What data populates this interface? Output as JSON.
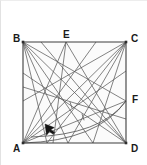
{
  "figure": {
    "type": "geometry-diagram",
    "background_color": "#ffffff",
    "fill_color": "#fbfbfb",
    "line_color": "#5a5a5a",
    "square_line_color": "#3c3c3c",
    "label_color": "#1a1a1a",
    "frame_border_color": "#e4e4e4",
    "square": {
      "corners": {
        "A": {
          "x": 22,
          "y": 142
        },
        "B": {
          "x": 22,
          "y": 41
        },
        "C": {
          "x": 125,
          "y": 41
        },
        "D": {
          "x": 125,
          "y": 142
        }
      },
      "points_on_edges": {
        "E": {
          "x": 65,
          "y": 41,
          "edge": "top"
        },
        "F": {
          "x": 125,
          "y": 100,
          "edge": "right"
        }
      }
    },
    "labels": [
      {
        "name": "B",
        "text": "B",
        "x": 12,
        "y": 33
      },
      {
        "name": "E",
        "text": "E",
        "x": 62,
        "y": 29
      },
      {
        "name": "C",
        "text": "C",
        "x": 130,
        "y": 33
      },
      {
        "name": "F",
        "text": "F",
        "x": 131,
        "y": 94
      },
      {
        "name": "A",
        "text": "A",
        "x": 12,
        "y": 143
      },
      {
        "name": "D",
        "text": "D",
        "x": 130,
        "y": 143
      }
    ],
    "cursor": {
      "x": 44,
      "y": 123,
      "color": "#151515"
    },
    "segments": [
      {
        "from": [
          22,
          41
        ],
        "to": [
          125,
          142
        ]
      },
      {
        "from": [
          22,
          142
        ],
        "to": [
          125,
          41
        ]
      },
      {
        "from": [
          22,
          41
        ],
        "to": [
          125,
          100
        ]
      },
      {
        "from": [
          22,
          41
        ],
        "to": [
          92,
          142
        ]
      },
      {
        "from": [
          22,
          41
        ],
        "to": [
          67,
          142
        ]
      },
      {
        "from": [
          22,
          41
        ],
        "to": [
          46,
          142
        ]
      },
      {
        "from": [
          125,
          41
        ],
        "to": [
          22,
          100
        ]
      },
      {
        "from": [
          125,
          41
        ],
        "to": [
          46,
          142
        ]
      },
      {
        "from": [
          125,
          41
        ],
        "to": [
          67,
          142
        ]
      },
      {
        "from": [
          125,
          41
        ],
        "to": [
          92,
          142
        ]
      },
      {
        "from": [
          22,
          142
        ],
        "to": [
          125,
          70
        ]
      },
      {
        "from": [
          22,
          142
        ],
        "to": [
          125,
          100
        ]
      },
      {
        "from": [
          22,
          142
        ],
        "to": [
          95,
          41
        ]
      },
      {
        "from": [
          22,
          142
        ],
        "to": [
          65,
          41
        ]
      },
      {
        "from": [
          125,
          142
        ],
        "to": [
          22,
          72
        ]
      },
      {
        "from": [
          125,
          142
        ],
        "to": [
          65,
          41
        ]
      },
      {
        "from": [
          125,
          142
        ],
        "to": [
          40,
          41
        ]
      },
      {
        "from": [
          65,
          41
        ],
        "to": [
          52,
          142
        ]
      },
      {
        "from": [
          22,
          86
        ],
        "to": [
          125,
          118
        ]
      }
    ],
    "arcs": [
      {
        "from": [
          22,
          142
        ],
        "to": [
          125,
          100
        ],
        "sweep_control": [
          96,
          140
        ]
      },
      {
        "from": [
          30,
          136
        ],
        "to": [
          125,
          100
        ],
        "sweep_control": [
          100,
          134
        ]
      }
    ],
    "tick_marks": [
      {
        "x": 70,
        "y": 104,
        "angle": 72
      },
      {
        "x": 82,
        "y": 116,
        "angle": 72
      }
    ]
  }
}
